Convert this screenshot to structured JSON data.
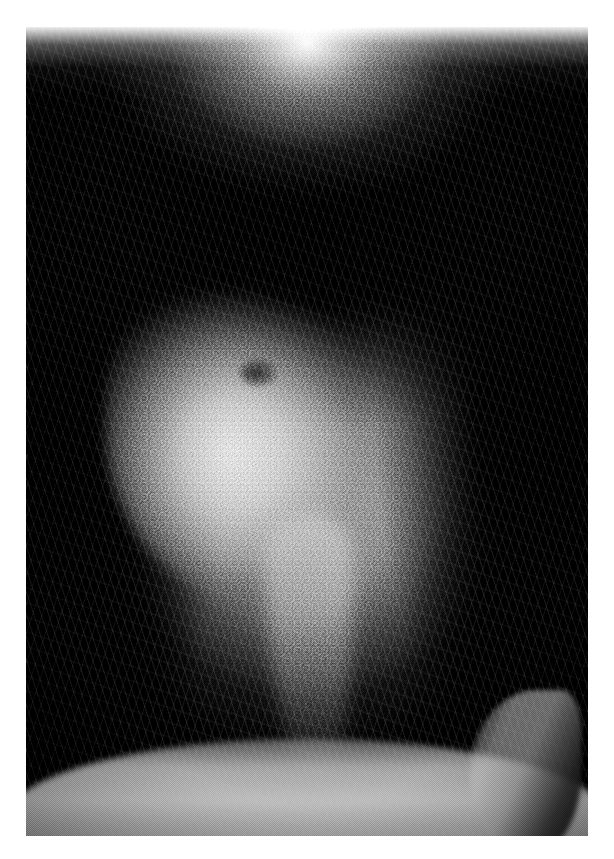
{
  "document": {
    "type": "clinical-photograph",
    "orientation": "portrait",
    "color_mode": "grayscale",
    "canvas": {
      "width": 614,
      "height": 859,
      "background": "#ffffff"
    },
    "plate": {
      "x": 26,
      "y": 27,
      "width": 562,
      "height": 809
    }
  },
  "image": {
    "subject": "scalp with circumscribed hairless patch",
    "view": "close-up top-of-head view, vertex toward top",
    "description": "Dense dark tightly-curled hair surrounds a well-demarcated oval area of smooth pale skin with almost no hair, tapering into a narrow light band that runs down toward the lower edge; a curved band of lighter skin crosses the bottom.",
    "palette": {
      "paper_white": "#ffffff",
      "hair_black": "#0a0a09",
      "hair_shadow": "#050504",
      "patch_highlight": "#f4f3f0",
      "patch_midtone": "#bab7b1",
      "patch_edge": "#807d78",
      "skin_band": "#c4c1bb",
      "strand_highlight": "#d2d0cb"
    },
    "regions": [
      {
        "name": "hair-canopy-top",
        "label": "Dense dark hair canopy",
        "bounds_pct": {
          "x": 0,
          "y": 0,
          "w": 100,
          "h": 34
        }
      },
      {
        "name": "hair-mass-left",
        "label": "Dark hair mass, left",
        "bounds_pct": {
          "x": 0,
          "y": 20,
          "w": 32,
          "h": 70
        }
      },
      {
        "name": "hair-mass-right",
        "label": "Dark hair mass, right",
        "bounds_pct": {
          "x": 68,
          "y": 18,
          "w": 32,
          "h": 72
        }
      },
      {
        "name": "alopecia-patch",
        "label": "Hairless pale patch",
        "bounds_pct": {
          "x": 14,
          "y": 26,
          "w": 56,
          "h": 46
        }
      },
      {
        "name": "parting-band",
        "label": "Narrow tapering light band",
        "bounds_pct": {
          "x": 42,
          "y": 60,
          "w": 17,
          "h": 34
        }
      },
      {
        "name": "dark-tuft",
        "label": "Small retained dark hair tuft",
        "bounds_pct": {
          "x": 38,
          "y": 41,
          "w": 6.5,
          "h": 3.4
        }
      },
      {
        "name": "forehead-band",
        "label": "Lower lighter skin band",
        "bounds_pct": {
          "x": -4,
          "y": 88,
          "w": 108,
          "h": 16
        }
      },
      {
        "name": "ear-silhouette",
        "label": "Ear / sideburn silhouette",
        "bounds_pct": {
          "x": 79,
          "y": 82,
          "w": 20,
          "h": 20
        }
      }
    ]
  }
}
